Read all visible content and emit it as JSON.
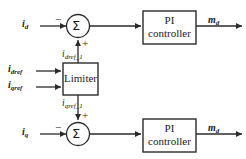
{
  "diagram": {
    "background_color": "#ffffff",
    "line_color": "#2b2b2b",
    "text_color": "#1a1a1a"
  },
  "inputs": {
    "id": {
      "base": "i",
      "sub": "d"
    },
    "iq": {
      "base": "i",
      "sub": "q"
    },
    "idref": {
      "base": "i",
      "sub": "dref"
    },
    "iqref": {
      "base": "i",
      "sub": "qref"
    }
  },
  "internal_signals": {
    "idref_1": {
      "base": "i",
      "sub": "dref_1"
    },
    "iqref_1": {
      "base": "i",
      "sub": "qref_1"
    }
  },
  "outputs": {
    "md_top": {
      "base": "m",
      "sub": "d"
    },
    "md_bottom": {
      "base": "m",
      "sub": "d"
    }
  },
  "blocks": {
    "limiter": {
      "label": "Limiter"
    },
    "pi_top": {
      "line1": "PI",
      "line2": "controller"
    },
    "pi_bottom": {
      "line1": "PI",
      "line2": "controller"
    }
  },
  "summing_junctions": {
    "top": {
      "symbol": "Σ",
      "input_sign": "−",
      "feedback_sign": "+"
    },
    "bottom": {
      "symbol": "Σ",
      "input_sign": "−",
      "feedback_sign": "+"
    }
  }
}
